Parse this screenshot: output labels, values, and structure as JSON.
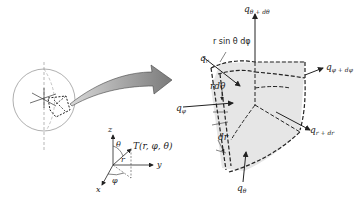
{
  "figure": {
    "colors": {
      "line": "#222222",
      "sphere": "#9a9a9a",
      "element_fill": "#e6e6e6",
      "arrow_fill": "#8c8c8c",
      "background": "#ffffff"
    }
  },
  "labels": {
    "q_theta_dtheta": {
      "base": "q",
      "sub": "θ + dθ"
    },
    "r_sin_theta_dphi": "r sin θ dφ",
    "q_r": {
      "base": "q",
      "sub": "r"
    },
    "q_phi_dphi": {
      "base": "q",
      "sub": "φ + dφ"
    },
    "r_dtheta": "rdθ",
    "q_phi": {
      "base": "q",
      "sub": "φ"
    },
    "q_r_dr": {
      "base": "q",
      "sub": "r + dr"
    },
    "dr": "dr",
    "q_theta": {
      "base": "q",
      "sub": "θ"
    }
  },
  "axes": {
    "z": "z",
    "y": "y",
    "x": "x",
    "theta": "θ",
    "phi": "φ",
    "r": "r",
    "point": "T(r, φ, θ)"
  }
}
